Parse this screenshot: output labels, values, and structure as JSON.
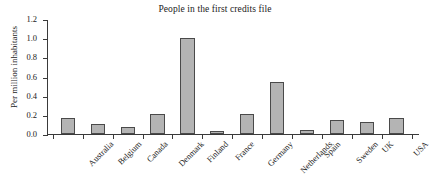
{
  "chart_data": {
    "type": "bar",
    "title": "People in the first credits file",
    "xlabel": "",
    "ylabel": "Per million inhabitants",
    "ylim": [
      0.0,
      1.2
    ],
    "yticks": [
      "0.0",
      "0.2",
      "0.4",
      "0.6",
      "0.8",
      "1.0",
      "1.2"
    ],
    "ytick_values": [
      0.0,
      0.2,
      0.4,
      0.6,
      0.8,
      1.0,
      1.2
    ],
    "grid": false,
    "legend": false,
    "bar_color": "#b4b4b4",
    "bar_edge_color": "#4a4a4a",
    "axis_color": "#3a3a3a",
    "categories": [
      "Australia",
      "Belgium",
      "Canada",
      "Denmark",
      "Finland",
      "France",
      "Germany",
      "Netherlands",
      "Spain",
      "Sweden",
      "UK",
      "USA"
    ],
    "values": [
      0.17,
      0.105,
      0.075,
      0.21,
      1.0,
      0.03,
      0.21,
      0.545,
      0.04,
      0.145,
      0.13,
      0.17
    ]
  }
}
